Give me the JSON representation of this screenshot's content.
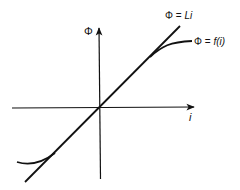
{
  "diagram": {
    "type": "flux-current characteristic",
    "colors": {
      "stroke": "#111111",
      "background": "#ffffff"
    },
    "axes": {
      "x_label": "i",
      "y_label": "Φ"
    },
    "curves": [
      {
        "id": "linear",
        "label": "Φ = Li",
        "label_parts": [
          "Φ = ",
          "Li"
        ]
      },
      {
        "id": "nonlinear",
        "label": "Φ = f(i)",
        "label_parts": [
          "Φ = ",
          "f(i)"
        ]
      }
    ]
  }
}
